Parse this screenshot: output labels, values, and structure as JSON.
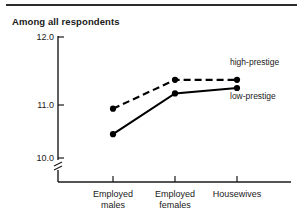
{
  "figure": {
    "title": "Among all respondents",
    "has_top_rule": true
  },
  "chart_data": {
    "type": "line",
    "title": "Among all respondents",
    "xlabel": "",
    "ylabel": "",
    "categories": [
      "Employed males",
      "Employed females",
      "Housewives"
    ],
    "category_lines": [
      [
        "Employed",
        "males"
      ],
      [
        "Employed",
        "females"
      ],
      [
        "Housewives"
      ]
    ],
    "series": [
      {
        "name": "high-prestige",
        "style": "dashed",
        "marker": "filled-circle",
        "values": [
          10.93,
          11.37,
          11.37
        ]
      },
      {
        "name": "low-prestige",
        "style": "solid",
        "marker": "filled-circle",
        "values": [
          10.45,
          11.17,
          11.25
        ]
      }
    ],
    "ylim": [
      10.0,
      12.0
    ],
    "yticks": [
      12.0,
      11.0,
      10.0
    ],
    "ytick_labels": [
      "12.0",
      "11.0",
      "10.0"
    ],
    "axis_break": true,
    "grid": false,
    "legend_position": "right-inline",
    "colors": {
      "series": "#000000",
      "axis": "#1a1a1a",
      "background": "#ffffff"
    }
  },
  "legend": {
    "high": "high-prestige",
    "low": "low-prestige"
  },
  "yaxis": {
    "t0": "12.0",
    "t1": "11.0",
    "t2": "10.0"
  },
  "xaxis": {
    "c0_line1": "Employed",
    "c0_line2": "males",
    "c1_line1": "Employed",
    "c1_line2": "females",
    "c2_line1": "Housewives"
  }
}
